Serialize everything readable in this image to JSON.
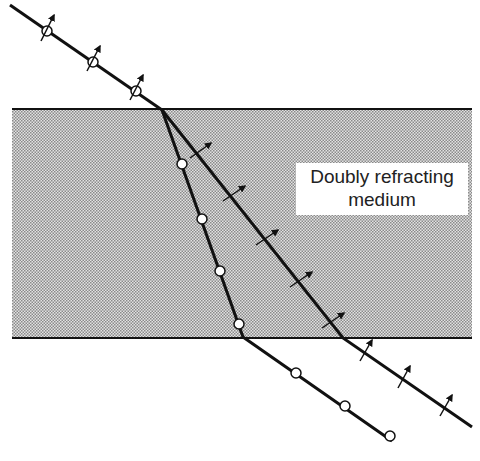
{
  "diagram": {
    "medium_label_line1": "Doubly refracting",
    "medium_label_line2": "medium",
    "colors": {
      "ray": "#111111",
      "medium_fill": "#c8c8c8",
      "background": "#ffffff"
    },
    "rays": [
      {
        "name": "incident-ray",
        "polarization_symbol": "circle-with-arrow",
        "markers": 3
      },
      {
        "name": "ordinary-ray",
        "polarization_symbol": "open-circle",
        "markers_inside": 4,
        "markers_outside": 3
      },
      {
        "name": "extraordinary-ray",
        "polarization_symbol": "arrow",
        "markers_inside": 5,
        "markers_outside": 3
      }
    ]
  }
}
